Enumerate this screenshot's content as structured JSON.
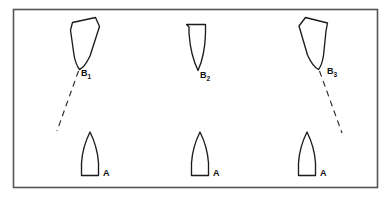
{
  "figure": {
    "name": "ship-encounter-diagram",
    "background_color": "#ffffff",
    "frame": {
      "name": "figure-border",
      "x": 13,
      "y": 9,
      "width": 365,
      "height": 179,
      "stroke_color": "#555555"
    }
  },
  "ships": [
    {
      "id": "B1",
      "label": "B",
      "subscript": "1",
      "role": "give-way-vessel",
      "row": "top",
      "column": 1,
      "heading_deg": 200,
      "label_x": 81,
      "label_y": 76,
      "hull_cx": 89,
      "hull_cy": 45,
      "description": "tilted hull, bow pointing down-left"
    },
    {
      "id": "B2",
      "label": "B",
      "subscript": "2",
      "role": "give-way-vessel",
      "row": "top",
      "column": 2,
      "heading_deg": 180,
      "label_x": 200,
      "label_y": 78,
      "hull_cx": 196,
      "hull_cy": 46,
      "description": "upright hull, bow pointing down"
    },
    {
      "id": "B3",
      "label": "B",
      "subscript": "3",
      "role": "give-way-vessel",
      "row": "top",
      "column": 3,
      "heading_deg": 160,
      "label_x": 327,
      "label_y": 74,
      "hull_cx": 312,
      "hull_cy": 45,
      "description": "tilted hull, bow pointing down-right"
    },
    {
      "id": "A1",
      "label": "A",
      "subscript": "",
      "role": "stand-on-vessel",
      "row": "bottom",
      "column": 1,
      "heading_deg": 0,
      "label_x": 103,
      "label_y": 176,
      "hull_cx": 90,
      "hull_cy": 158,
      "description": "upright hull, bow pointing up"
    },
    {
      "id": "A2",
      "label": "A",
      "subscript": "",
      "role": "stand-on-vessel",
      "row": "bottom",
      "column": 2,
      "heading_deg": 0,
      "label_x": 213,
      "label_y": 176,
      "hull_cx": 200,
      "hull_cy": 158,
      "description": "upright hull, bow pointing up"
    },
    {
      "id": "A3",
      "label": "A",
      "subscript": "",
      "role": "stand-on-vessel",
      "row": "bottom",
      "column": 3,
      "heading_deg": 0,
      "label_x": 320,
      "label_y": 176,
      "hull_cx": 307,
      "hull_cy": 158,
      "description": "upright hull, bow pointing up"
    }
  ],
  "tracks": [
    {
      "id": "track-B1",
      "name": "dashed-track-b1",
      "from_ship": "B1",
      "x1": 78,
      "y1": 70,
      "x2": 57,
      "y2": 131,
      "style": "dashed"
    },
    {
      "id": "track-B3",
      "name": "dashed-track-b3",
      "from_ship": "B3",
      "x1": 320,
      "y1": 70,
      "x2": 342,
      "y2": 133,
      "style": "dashed"
    }
  ],
  "colors": {
    "outline": "#1b1b1b",
    "frame": "#555555",
    "dash": "#2b2b2b",
    "background": "#ffffff"
  }
}
